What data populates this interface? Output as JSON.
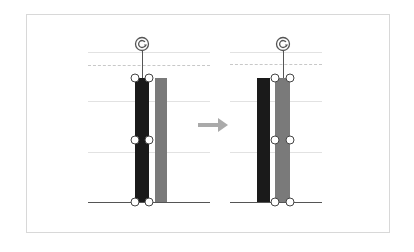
{
  "diagram": {
    "colors": {
      "series_1_bar": "#1a1a1a",
      "series_2_bar": "#7a7a7a",
      "gridline": "#e2e2e2",
      "dashed_gridline": "#c8c8c8",
      "baseline": "#555555",
      "handle_border": "#444444",
      "arrow": "#aaaaaa",
      "frame_border": "#d8d8d8"
    },
    "before": {
      "label": "",
      "selected_bar": "series_1",
      "bars": [
        {
          "series": "series_1",
          "color": "#1a1a1a"
        },
        {
          "series": "series_2",
          "color": "#7a7a7a"
        }
      ]
    },
    "arrow": {
      "direction": "right"
    },
    "after": {
      "label": "",
      "selected_bar": "series_2",
      "bars": [
        {
          "series": "series_1",
          "color": "#1a1a1a"
        },
        {
          "series": "series_2",
          "color": "#7a7a7a"
        }
      ]
    }
  }
}
